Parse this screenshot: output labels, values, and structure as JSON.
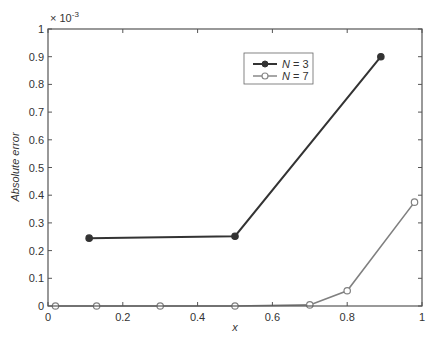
{
  "chart_data": {
    "type": "line",
    "title": "",
    "xlabel": "x",
    "ylabel": "Absolute error",
    "y_multiplier_label": "× 10",
    "y_multiplier_exp": "-3",
    "xlim": [
      0,
      1
    ],
    "ylim": [
      0,
      1
    ],
    "xticks": [
      0,
      0.2,
      0.4,
      0.6,
      0.8,
      1
    ],
    "xtick_labels": [
      "0",
      "0.2",
      "0.4",
      "0.6",
      "0.8",
      "1"
    ],
    "yticks": [
      0,
      0.1,
      0.2,
      0.3,
      0.4,
      0.5,
      0.6,
      0.7,
      0.8,
      0.9,
      1
    ],
    "ytick_labels": [
      "0",
      "0.1",
      "0.2",
      "0.3",
      "0.4",
      "0.5",
      "0.6",
      "0.7",
      "0.8",
      "0.9",
      "1"
    ],
    "grid": false,
    "legend_position": "top-center-right",
    "series": [
      {
        "name": "N = 3",
        "legend_var": "N",
        "legend_eq": " = 3",
        "marker": "filled-circle",
        "color": "#333333",
        "x": [
          0.11,
          0.5,
          0.89
        ],
        "y": [
          0.245,
          0.252,
          0.9
        ]
      },
      {
        "name": "N = 7",
        "legend_var": "N",
        "legend_eq": " = 7",
        "marker": "open-circle",
        "color": "#808080",
        "x": [
          0.02,
          0.13,
          0.3,
          0.5,
          0.7,
          0.8,
          0.98
        ],
        "y": [
          0.0,
          0.0,
          0.0,
          0.0,
          0.004,
          0.055,
          0.375
        ]
      }
    ]
  }
}
